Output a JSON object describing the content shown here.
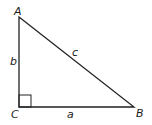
{
  "diagram": {
    "type": "right-triangle",
    "stroke_color": "#222222",
    "vertices": [
      {
        "label": "A",
        "x": 19,
        "y": 17
      },
      {
        "label": "B",
        "x": 134,
        "y": 107
      },
      {
        "label": "C",
        "x": 19,
        "y": 107
      }
    ],
    "sides": [
      {
        "label": "a",
        "between": "C-B"
      },
      {
        "label": "b",
        "between": "A-C"
      },
      {
        "label": "c",
        "between": "A-B"
      }
    ],
    "right_angle_at": "C"
  },
  "labels": {
    "A": "A",
    "B": "B",
    "C": "C",
    "a": "a",
    "b": "b",
    "c": "c"
  }
}
